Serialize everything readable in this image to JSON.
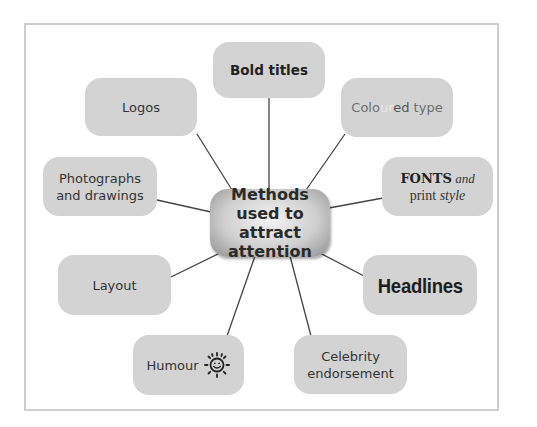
{
  "diagram": {
    "type": "mind-map",
    "center": {
      "lines": [
        "Methods",
        "used to attract",
        "attention"
      ]
    },
    "nodes": [
      {
        "id": "bold-titles",
        "label": "Bold titles"
      },
      {
        "id": "coloured-type",
        "parts": [
          "Colo",
          "ur",
          "ed",
          " type"
        ]
      },
      {
        "id": "fonts-print-style",
        "line1_a": "FONTS",
        "line1_b": " and",
        "line2_a": "print ",
        "line2_b": "style"
      },
      {
        "id": "headlines",
        "label": "Headlines"
      },
      {
        "id": "celebrity-endorsement",
        "lines": [
          "Celebrity",
          "endorsement"
        ]
      },
      {
        "id": "humour",
        "label": "Humour",
        "icon": "smiling-sun-icon"
      },
      {
        "id": "layout",
        "label": "Layout"
      },
      {
        "id": "photographs-drawings",
        "lines": [
          "Photographs",
          "and drawings"
        ]
      },
      {
        "id": "logos",
        "label": "Logos"
      }
    ],
    "colors": {
      "node_fill": "#d3d3d3",
      "frame": "#cfcfcf",
      "connector": "#444444"
    }
  }
}
